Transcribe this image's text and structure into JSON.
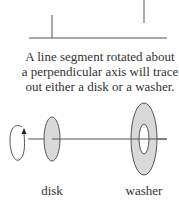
{
  "diagram": {
    "caption_lines": [
      "A line segment rotated about",
      "a perpendicular axis will trace",
      "out either a disk or a washer."
    ],
    "labels": {
      "disk": "disk",
      "washer": "washer"
    },
    "colors": {
      "line": "#555555",
      "fill": "#d9d9d9"
    }
  }
}
